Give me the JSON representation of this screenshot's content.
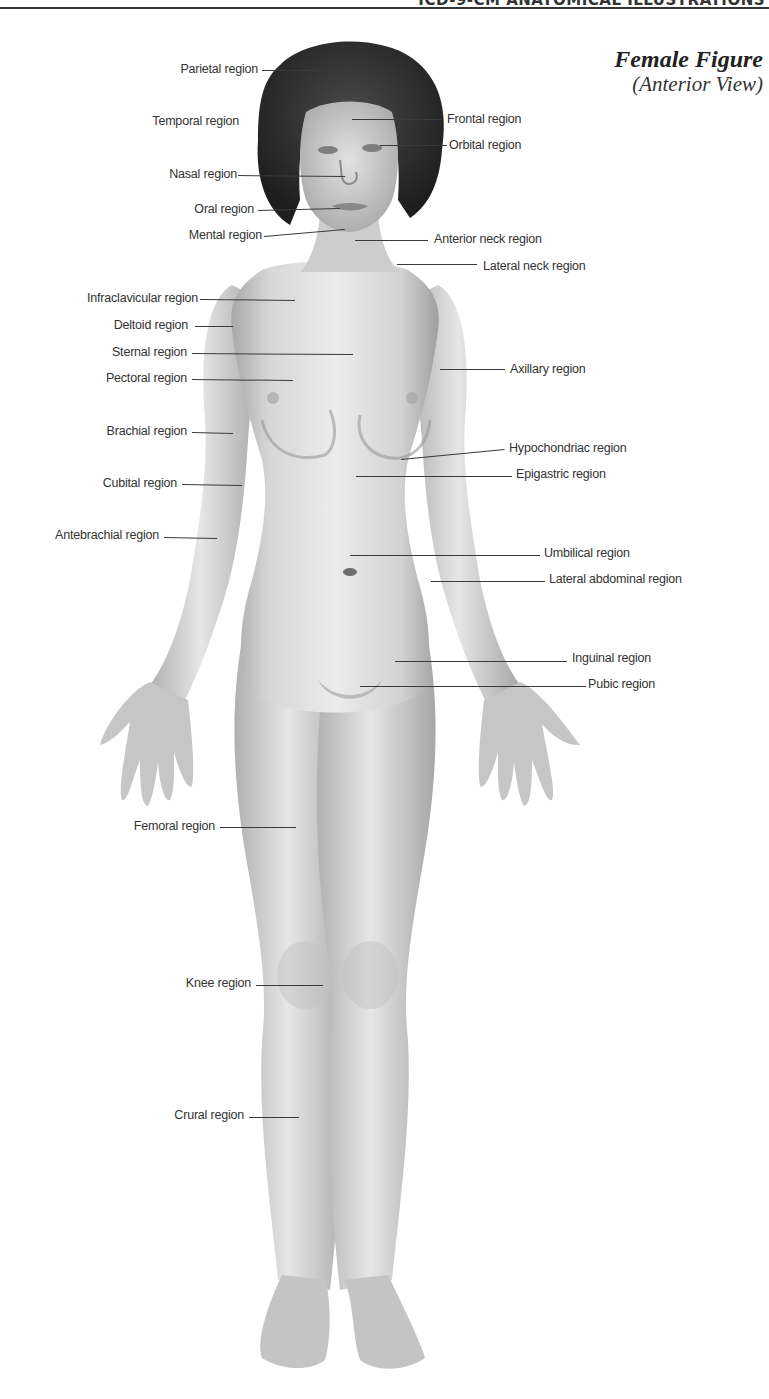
{
  "header": {
    "running_head": "ICD-9-CM ANATOMICAL ILLUSTRATIONS",
    "title": "Female Figure",
    "subtitle": "(Anterior View)"
  },
  "labels_left": [
    {
      "id": "parietal",
      "text": "Parietal region",
      "right": 258,
      "y": 70,
      "line": {
        "x1": 262,
        "y1": 70,
        "x2": 320,
        "y2": 70
      }
    },
    {
      "id": "temporal",
      "text": "Temporal region",
      "right": 239,
      "y": 122,
      "line": null
    },
    {
      "id": "nasal",
      "text": "Nasal region",
      "right": 237,
      "y": 175,
      "line": {
        "x1": 238,
        "y1": 175,
        "x2": 345,
        "y2": 176
      }
    },
    {
      "id": "oral",
      "text": "Oral region",
      "right": 254,
      "y": 210,
      "line": {
        "x1": 258,
        "y1": 210,
        "x2": 340,
        "y2": 208
      }
    },
    {
      "id": "mental",
      "text": "Mental region",
      "right": 262,
      "y": 236,
      "line": {
        "x1": 264,
        "y1": 236,
        "x2": 345,
        "y2": 229
      }
    },
    {
      "id": "infraclavicular",
      "text": "Infraclavicular region",
      "right": 198,
      "y": 299,
      "line": {
        "x1": 200,
        "y1": 299,
        "x2": 295,
        "y2": 300
      }
    },
    {
      "id": "deltoid",
      "text": "Deltoid region",
      "right": 188,
      "y": 326,
      "line": {
        "x1": 195,
        "y1": 326,
        "x2": 233,
        "y2": 326
      }
    },
    {
      "id": "sternal",
      "text": "Sternal region",
      "right": 187,
      "y": 353,
      "line": {
        "x1": 192,
        "y1": 353,
        "x2": 353,
        "y2": 354
      }
    },
    {
      "id": "pectoral",
      "text": "Pectoral region",
      "right": 187,
      "y": 379,
      "line": {
        "x1": 192,
        "y1": 379,
        "x2": 293,
        "y2": 380
      }
    },
    {
      "id": "brachial",
      "text": "Brachial region",
      "right": 187,
      "y": 432,
      "line": {
        "x1": 192,
        "y1": 432,
        "x2": 233,
        "y2": 433
      }
    },
    {
      "id": "cubital",
      "text": "Cubital region",
      "right": 177,
      "y": 484,
      "line": {
        "x1": 182,
        "y1": 484,
        "x2": 242,
        "y2": 485
      }
    },
    {
      "id": "antebrachial",
      "text": "Antebrachial region",
      "right": 159,
      "y": 536,
      "line": {
        "x1": 164,
        "y1": 537,
        "x2": 217,
        "y2": 538
      }
    },
    {
      "id": "femoral",
      "text": "Femoral region",
      "right": 215,
      "y": 827,
      "line": {
        "x1": 220,
        "y1": 827,
        "x2": 296,
        "y2": 827
      }
    },
    {
      "id": "knee",
      "text": "Knee region",
      "right": 251,
      "y": 984,
      "line": {
        "x1": 256,
        "y1": 985,
        "x2": 323,
        "y2": 985
      }
    },
    {
      "id": "crural",
      "text": "Crural region",
      "right": 244,
      "y": 1116,
      "line": {
        "x1": 249,
        "y1": 1117,
        "x2": 299,
        "y2": 1117
      }
    }
  ],
  "labels_right": [
    {
      "id": "frontal",
      "text": "Frontal region",
      "left": 447,
      "y": 120,
      "line": {
        "x1": 352,
        "y1": 119,
        "x2": 442,
        "y2": 119
      }
    },
    {
      "id": "orbital",
      "text": "Orbital region",
      "left": 449,
      "y": 146,
      "line": {
        "x1": 380,
        "y1": 145,
        "x2": 447,
        "y2": 145
      }
    },
    {
      "id": "anterior_neck",
      "text": "Anterior neck region",
      "left": 434,
      "y": 240,
      "line": {
        "x1": 355,
        "y1": 240,
        "x2": 428,
        "y2": 240
      }
    },
    {
      "id": "lateral_neck",
      "text": "Lateral neck region",
      "left": 483,
      "y": 267,
      "line": {
        "x1": 397,
        "y1": 264,
        "x2": 477,
        "y2": 264
      }
    },
    {
      "id": "axillary",
      "text": "Axillary region",
      "left": 510,
      "y": 370,
      "line": {
        "x1": 440,
        "y1": 369,
        "x2": 505,
        "y2": 369
      }
    },
    {
      "id": "hypochondriac",
      "text": "Hypochondriac region",
      "left": 509,
      "y": 449,
      "line": {
        "x1": 401,
        "y1": 459,
        "x2": 505,
        "y2": 449
      }
    },
    {
      "id": "epigastric",
      "text": "Epigastric region",
      "left": 516,
      "y": 475,
      "line": {
        "x1": 356,
        "y1": 476,
        "x2": 512,
        "y2": 476
      }
    },
    {
      "id": "umbilical",
      "text": "Umbilical region",
      "left": 544,
      "y": 554,
      "line": {
        "x1": 350,
        "y1": 555,
        "x2": 540,
        "y2": 555
      }
    },
    {
      "id": "lateral_abdominal",
      "text": "Lateral abdominal region",
      "left": 549,
      "y": 580,
      "line": {
        "x1": 431,
        "y1": 581,
        "x2": 545,
        "y2": 581
      }
    },
    {
      "id": "inguinal",
      "text": "Inguinal region",
      "left": 572,
      "y": 659,
      "line": {
        "x1": 395,
        "y1": 661,
        "x2": 567,
        "y2": 661
      }
    },
    {
      "id": "pubic",
      "text": "Pubic region",
      "left": 588,
      "y": 685,
      "line": {
        "x1": 360,
        "y1": 686,
        "x2": 586,
        "y2": 686
      }
    }
  ],
  "figure": {
    "skin_light": "#eeeeee",
    "skin_mid": "#cfcfcf",
    "skin_dark": "#9a9a9a",
    "hair": "#2b2b2b"
  }
}
